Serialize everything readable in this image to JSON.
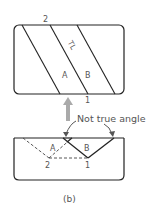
{
  "figure": {
    "caption": "(b)",
    "top_view": {
      "labels": {
        "top_point": "2",
        "bottom_point": "1",
        "true_length": "TL",
        "face_a": "A",
        "face_b": "B"
      }
    },
    "projection_arrow": {
      "color": "#aaaaaa"
    },
    "bottom_view": {
      "labels": {
        "face_a": "A",
        "face_b": "B",
        "point_2": "2",
        "point_1": "1"
      },
      "annotation": "Not true angle"
    },
    "colors": {
      "line": "#222222",
      "label": "#555555",
      "arrow": "#aaaaaa"
    }
  }
}
